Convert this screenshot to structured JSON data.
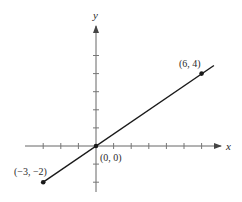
{
  "chart_data": {
    "type": "line",
    "title": "",
    "xlabel": "x",
    "ylabel": "y",
    "xlim": [
      -4,
      7
    ],
    "ylim": [
      -3,
      6
    ],
    "grid": false,
    "legend": null,
    "x_ticks": [
      -3,
      -2,
      -1,
      1,
      2,
      3,
      4,
      5,
      6
    ],
    "y_ticks": [
      -2,
      -1,
      1,
      2,
      3,
      4,
      5
    ],
    "series": [
      {
        "name": "line through origin",
        "x": [
          -3,
          0,
          6
        ],
        "y": [
          -2,
          0,
          4
        ],
        "extends_beyond": [
          6.7,
          4.45
        ]
      }
    ],
    "points": [
      {
        "x": -3,
        "y": -2,
        "label": "(−3, −2)"
      },
      {
        "x": 0,
        "y": 0,
        "label": "(0, 0)"
      },
      {
        "x": 6,
        "y": 4,
        "label": "(6, 4)"
      }
    ],
    "colors": {
      "line": "#1a1a1a",
      "axis": "#555555",
      "text": "#2a2a2a"
    }
  }
}
